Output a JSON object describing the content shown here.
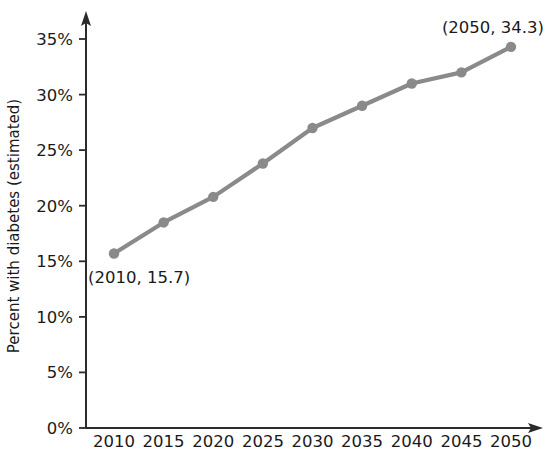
{
  "chart_data": {
    "type": "line",
    "title": "",
    "subtitle": "",
    "xlabel": "",
    "ylabel": "Percent with diabetes (estimated)",
    "x": [
      2010,
      2015,
      2020,
      2025,
      2030,
      2035,
      2040,
      2045,
      2050
    ],
    "values": [
      15.7,
      18.5,
      20.8,
      23.8,
      27.0,
      29.0,
      31.0,
      32.0,
      34.3
    ],
    "series": [
      {
        "name": "Percent with diabetes (estimated)",
        "values": [
          15.7,
          18.5,
          20.8,
          23.8,
          27.0,
          29.0,
          31.0,
          32.0,
          34.3
        ]
      }
    ],
    "xtick_labels": [
      "2010",
      "2015",
      "2020",
      "2025",
      "2030",
      "2035",
      "2040",
      "2045",
      "2050"
    ],
    "ytick_labels": [
      "0%",
      "5%",
      "10%",
      "15%",
      "20%",
      "25%",
      "30%",
      "35%"
    ],
    "ytick_values": [
      0,
      5,
      10,
      15,
      20,
      25,
      30,
      35
    ],
    "xlim": [
      2010,
      2050
    ],
    "ylim": [
      0,
      35
    ],
    "grid": false,
    "legend": "none",
    "series_color": "#8a8a8a",
    "axis_color": "#2b2b2b",
    "text_color": "#1a1a1a",
    "annotations": [
      {
        "label": "(2010, 15.7)",
        "x": 2010,
        "y": 15.7,
        "position": "below-right"
      },
      {
        "label": "(2050, 34.3)",
        "x": 2050,
        "y": 34.3,
        "position": "above-left"
      }
    ]
  }
}
